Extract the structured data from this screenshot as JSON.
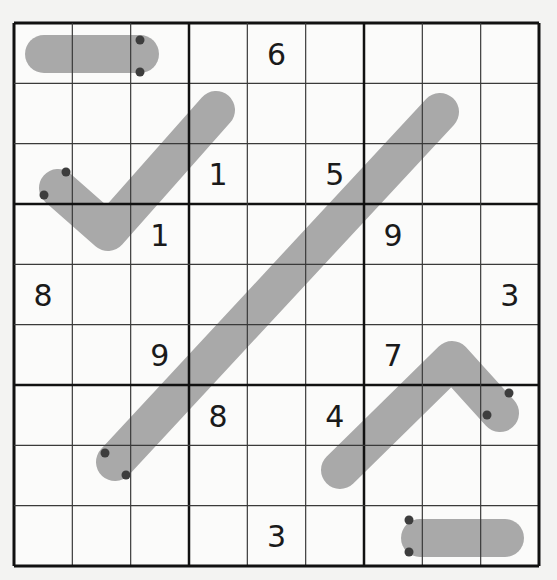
{
  "puzzle": {
    "type": "sudoku-9x9",
    "grid_origin": [
      14,
      23
    ],
    "grid_size": [
      525,
      543
    ],
    "colors": {
      "background": "#f3f3f2",
      "cell_background": "#fbfbfa",
      "thin_line": "#3a3a3a",
      "thick_line": "#111111",
      "line_fill": "#a9a9a9",
      "dot": "#3d3d3d",
      "digit": "#1a1a1a"
    },
    "givens": [
      {
        "row": 0,
        "col": 4,
        "value": "6"
      },
      {
        "row": 2,
        "col": 3,
        "value": "1"
      },
      {
        "row": 2,
        "col": 5,
        "value": "5"
      },
      {
        "row": 3,
        "col": 2,
        "value": "1"
      },
      {
        "row": 3,
        "col": 6,
        "value": "9"
      },
      {
        "row": 4,
        "col": 0,
        "value": "8"
      },
      {
        "row": 4,
        "col": 8,
        "value": "3"
      },
      {
        "row": 5,
        "col": 2,
        "value": "9"
      },
      {
        "row": 5,
        "col": 6,
        "value": "7"
      },
      {
        "row": 6,
        "col": 3,
        "value": "8"
      },
      {
        "row": 6,
        "col": 5,
        "value": "4"
      },
      {
        "row": 8,
        "col": 4,
        "value": "3"
      }
    ],
    "lines": [
      {
        "name": "line-top-left",
        "points": [
          [
            44,
            54
          ],
          [
            140,
            54
          ]
        ],
        "dots": [
          [
            140,
            40
          ],
          [
            140,
            72
          ]
        ]
      },
      {
        "name": "line-check",
        "points": [
          [
            58,
            188
          ],
          [
            108,
            232
          ],
          [
            216,
            110
          ]
        ],
        "dots": [
          [
            66,
            172
          ],
          [
            44,
            195
          ]
        ]
      },
      {
        "name": "line-diagonal",
        "points": [
          [
            440,
            112
          ],
          [
            115,
            462
          ]
        ],
        "dots": [
          [
            105,
            453
          ],
          [
            126,
            475
          ]
        ]
      },
      {
        "name": "line-chevron",
        "points": [
          [
            340,
            470
          ],
          [
            452,
            360
          ],
          [
            500,
            413
          ]
        ],
        "dots": [
          [
            509,
            393
          ],
          [
            487,
            415
          ]
        ]
      },
      {
        "name": "line-bottom",
        "points": [
          [
            420,
            538
          ],
          [
            505,
            538
          ]
        ],
        "dots": [
          [
            409,
            520
          ],
          [
            409,
            552
          ]
        ]
      }
    ]
  }
}
